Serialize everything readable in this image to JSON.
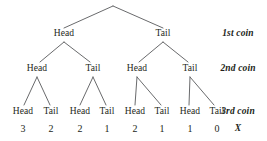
{
  "figure": {
    "background_color": "#ffffff",
    "line_color": "#58595b",
    "text_color": "#231f20"
  },
  "chart_data": {
    "type": "diagram",
    "diagram_type": "binary-probability-tree",
    "title": "",
    "depth": 3,
    "outcome_variable": "X",
    "outcome_meaning": "number of heads",
    "row_labels": [
      "1st coin",
      "2nd coin",
      "3rd coin",
      "X"
    ],
    "levels": [
      {
        "level": 1,
        "label": "1st coin",
        "nodes": [
          {
            "label": "Head",
            "x": 64,
            "y": 34
          },
          {
            "label": "Tail",
            "x": 163,
            "y": 34
          }
        ]
      },
      {
        "level": 2,
        "label": "2nd coin",
        "nodes": [
          {
            "label": "Head",
            "x": 37,
            "y": 69
          },
          {
            "label": "Tail",
            "x": 93,
            "y": 69
          },
          {
            "label": "Head",
            "x": 137,
            "y": 69
          },
          {
            "label": "Tail",
            "x": 190,
            "y": 69
          }
        ]
      },
      {
        "level": 3,
        "label": "3rd coin",
        "nodes": [
          {
            "label": "Head",
            "x": 23,
            "y": 112
          },
          {
            "label": "Tail",
            "x": 51,
            "y": 112
          },
          {
            "label": "Head",
            "x": 80,
            "y": 112
          },
          {
            "label": "Tail",
            "x": 107,
            "y": 112
          },
          {
            "label": "Head",
            "x": 135,
            "y": 112
          },
          {
            "label": "Tail",
            "x": 162,
            "y": 112
          },
          {
            "label": "Head",
            "x": 190,
            "y": 112
          },
          {
            "label": "Tail",
            "x": 217,
            "y": 112
          }
        ]
      }
    ],
    "outcomes": [
      {
        "path": "Head-Head-Head",
        "value": "3",
        "x": 23
      },
      {
        "path": "Head-Head-Tail",
        "value": "2",
        "x": 51
      },
      {
        "path": "Head-Tail-Head",
        "value": "2",
        "x": 80
      },
      {
        "path": "Head-Tail-Tail",
        "value": "1",
        "x": 107
      },
      {
        "path": "Tail-Head-Head",
        "value": "2",
        "x": 135
      },
      {
        "path": "Tail-Head-Tail",
        "value": "1",
        "x": 162
      },
      {
        "path": "Tail-Tail-Head",
        "value": "1",
        "x": 190
      },
      {
        "path": "Tail-Tail-Tail",
        "value": "0",
        "x": 217
      }
    ],
    "values": [
      3,
      2,
      2,
      1,
      2,
      1,
      1,
      0
    ],
    "root": {
      "x": 113,
      "y": 6
    },
    "edges": [
      {
        "from": [
          113,
          6
        ],
        "to": [
          64,
          28
        ]
      },
      {
        "from": [
          113,
          6
        ],
        "to": [
          163,
          28
        ]
      },
      {
        "from": [
          64,
          42
        ],
        "to": [
          40,
          62
        ]
      },
      {
        "from": [
          64,
          42
        ],
        "to": [
          90,
          62
        ]
      },
      {
        "from": [
          163,
          42
        ],
        "to": [
          139,
          62
        ]
      },
      {
        "from": [
          163,
          42
        ],
        "to": [
          188,
          62
        ]
      },
      {
        "from": [
          37,
          77
        ],
        "to": [
          24,
          105
        ]
      },
      {
        "from": [
          37,
          77
        ],
        "to": [
          50,
          105
        ]
      },
      {
        "from": [
          93,
          77
        ],
        "to": [
          80,
          105
        ]
      },
      {
        "from": [
          93,
          77
        ],
        "to": [
          106,
          105
        ]
      },
      {
        "from": [
          137,
          77
        ],
        "to": [
          135,
          105
        ]
      },
      {
        "from": [
          137,
          77
        ],
        "to": [
          161,
          105
        ]
      },
      {
        "from": [
          190,
          77
        ],
        "to": [
          189,
          105
        ]
      },
      {
        "from": [
          190,
          77
        ],
        "to": [
          214,
          105
        ]
      }
    ],
    "row_label_x": 238,
    "row_label_ys": [
      34,
      69,
      112,
      128
    ]
  }
}
